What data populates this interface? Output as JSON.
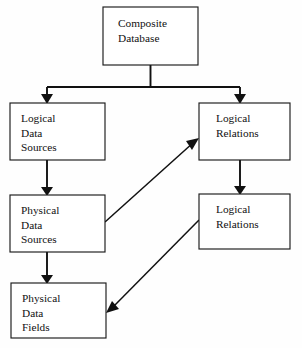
{
  "diagram": {
    "background_color": "#fefefe",
    "line_color": "#111111",
    "box_fill": "#ffffff",
    "nodes": [
      {
        "id": "composite-database",
        "lines": [
          "Composite",
          "Database"
        ],
        "x": 103,
        "y": 7,
        "w": 95,
        "h": 58,
        "text_x": 118,
        "text_y": 17,
        "line_height": 14.5
      },
      {
        "id": "logical-data-sources",
        "lines": [
          "Logical",
          "Data",
          "Sources"
        ],
        "x": 10,
        "y": 103,
        "w": 95,
        "h": 57,
        "text_x": 21,
        "text_y": 112,
        "line_height": 14.5
      },
      {
        "id": "logical-relations-top",
        "lines": [
          "Logical",
          "Relations"
        ],
        "x": 199,
        "y": 103,
        "w": 91,
        "h": 57,
        "text_x": 216,
        "text_y": 112,
        "line_height": 14.5
      },
      {
        "id": "physical-data-sources",
        "lines": [
          "Physical",
          "Data",
          "Sources"
        ],
        "x": 10,
        "y": 195,
        "w": 95,
        "h": 57,
        "text_x": 21,
        "text_y": 204,
        "line_height": 14.5
      },
      {
        "id": "logical-relations-bottom",
        "lines": [
          "Logical",
          "Relations"
        ],
        "x": 199,
        "y": 194,
        "w": 91,
        "h": 55,
        "text_x": 216,
        "text_y": 203,
        "line_height": 14.5
      },
      {
        "id": "physical-data-fields",
        "lines": [
          "Physical",
          "Data",
          "Fields"
        ],
        "x": 11,
        "y": 283,
        "w": 95,
        "h": 55,
        "text_x": 22,
        "text_y": 292,
        "line_height": 14.5
      }
    ],
    "connectors": [
      {
        "id": "composite-split-bus",
        "kind": "bus",
        "path": "M 150.5 65 L 150.5 87 M 47 87 L 240 87 M 47 87 L 47 96 M 240 87 L 240 96",
        "from": "composite-database",
        "to": [
          "logical-data-sources",
          "logical-relations-top"
        ]
      },
      {
        "id": "lds-to-pds",
        "kind": "vertical",
        "path": "M 47 160 L 47 189",
        "from": "logical-data-sources",
        "to": "physical-data-sources"
      },
      {
        "id": "pds-to-pdf",
        "kind": "vertical",
        "path": "M 47 252 L 47 277",
        "from": "physical-data-sources",
        "to": "physical-data-fields"
      },
      {
        "id": "lrtop-to-lrbottom",
        "kind": "vertical",
        "path": "M 240 160 L 240 188",
        "from": "logical-relations-top",
        "to": "logical-relations-bottom"
      },
      {
        "id": "pds-to-lrtop",
        "kind": "diagonal",
        "path": "M 105 222 L 194 142",
        "from": "physical-data-sources",
        "to": "logical-relations-top"
      },
      {
        "id": "lrbottom-to-pdf",
        "kind": "diagonal",
        "path": "M 199 220 L 113 307",
        "from": "logical-relations-bottom",
        "to": "physical-data-fields"
      }
    ],
    "arrow_heads": [
      {
        "id": "arrow-into-logical-data-sources",
        "points": "41,94 53,94 47,104",
        "target": "logical-data-sources"
      },
      {
        "id": "arrow-into-logical-relations-top",
        "points": "234,94 246,94 240,104",
        "target": "logical-relations-top"
      },
      {
        "id": "arrow-into-physical-data-sources",
        "points": "41,187 53,187 47,196",
        "target": "physical-data-sources"
      },
      {
        "id": "arrow-into-physical-data-fields",
        "points": "41,275 53,275 47,284",
        "target": "physical-data-fields"
      },
      {
        "id": "arrow-into-logical-relations-bottom",
        "points": "234,186 246,186 240,195",
        "target": "logical-relations-bottom"
      },
      {
        "id": "arrow-diagonal-to-logical-relations-top",
        "points": "199,138 186,141 192,150",
        "target": "logical-relations-top"
      },
      {
        "id": "arrow-diagonal-to-physical-data-fields",
        "points": "106,313 119,309 112,301",
        "target": "physical-data-fields"
      }
    ]
  }
}
